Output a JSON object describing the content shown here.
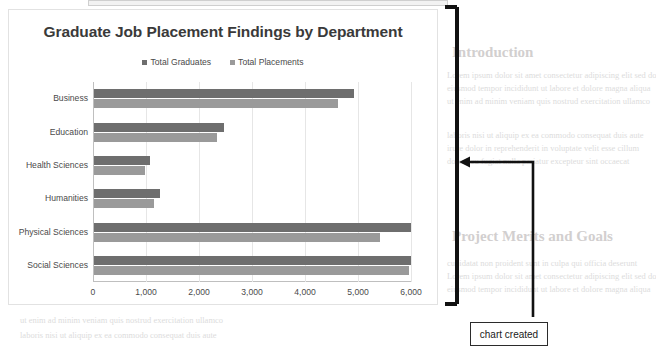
{
  "chart_data": {
    "type": "bar",
    "orientation": "horizontal",
    "title": "Graduate Job Placement Findings by Department",
    "xlabel": "",
    "ylabel": "",
    "xlim": [
      0,
      6000
    ],
    "xticks": [
      0,
      1000,
      2000,
      3000,
      4000,
      5000,
      6000
    ],
    "xtick_labels": [
      "0",
      "1,000",
      "2,000",
      "3,000",
      "4,000",
      "5,000",
      "6,000"
    ],
    "grid": true,
    "legend_position": "top",
    "categories": [
      "Business",
      "Education",
      "Health Sciences",
      "Humanities",
      "Physical Sciences",
      "Social Sciences"
    ],
    "series": [
      {
        "name": "Total Graduates",
        "color": "#6e6e6e",
        "values": [
          4900,
          2450,
          1050,
          1250,
          5980,
          5980
        ]
      },
      {
        "name": "Total Placements",
        "color": "#9a9a9a",
        "values": [
          4600,
          2330,
          960,
          1130,
          5400,
          5950
        ]
      }
    ]
  },
  "annotations": {
    "callout_label": "chart created",
    "bracket_name": "chart-region-bracket",
    "arrow_name": "callout-arrow"
  },
  "background_text": {
    "heading_1": "Introduction",
    "heading_2": "Project Merits and Goals",
    "lines": [
      "Lorem ipsum dolor sit amet consectetur adipiscing elit sed do",
      "eiusmod tempor incididunt ut labore et dolore magna aliqua",
      "ut enim ad minim veniam quis nostrud exercitation ullamco",
      "laboris nisi ut aliquip ex ea commodo consequat duis aute",
      "irure dolor in reprehenderit in voluptate velit esse cillum",
      "dolore eu fugiat nulla pariatur excepteur sint occaecat",
      "cupidatat non proident sunt in culpa qui officia deserunt"
    ]
  }
}
